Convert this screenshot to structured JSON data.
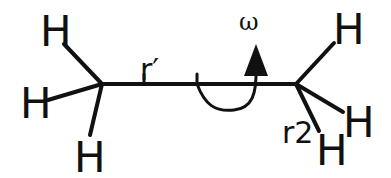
{
  "diagram": {
    "molecule": "ethane",
    "atoms": {
      "left_carbon_hydrogens": [
        "H",
        "H",
        "H"
      ],
      "right_carbon_hydrogens": [
        "H",
        "H",
        "H"
      ]
    },
    "labels": {
      "bond_r_prime": "r′",
      "bond_r2": "r2",
      "torsion": "ω"
    },
    "colors": {
      "stroke": "#111111",
      "background": "#ffffff"
    }
  }
}
